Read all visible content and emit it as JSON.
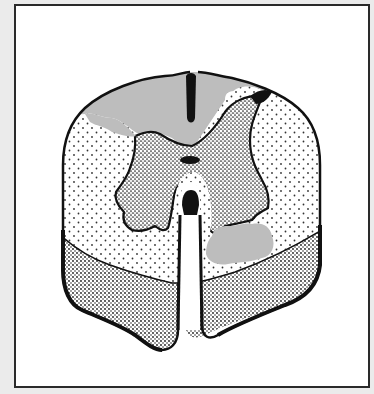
{
  "figure": {
    "caption": "",
    "colors": {
      "background": "#ebebeb",
      "frame_fill": "#ffffff",
      "frame_border": "#2a2a2a",
      "outline": "#111111",
      "lesion_gray": "#bdbdbd",
      "white_matter_dots": "#333333",
      "gray_matter_stipple": "#222222"
    },
    "regions": [
      {
        "name": "dorsal-columns-lesion",
        "fill": "gray"
      },
      {
        "name": "lateral-white-matter",
        "fill": "sparse-dots"
      },
      {
        "name": "gray-matter-butterfly",
        "fill": "dense-stipple"
      },
      {
        "name": "ventral-white-matter",
        "fill": "dense-stipple"
      },
      {
        "name": "right-anterolateral-lesion",
        "fill": "gray"
      },
      {
        "name": "left-dorsolateral-lesion",
        "fill": "gray"
      },
      {
        "name": "central-canal",
        "fill": "black"
      },
      {
        "name": "anterior-median-fissure",
        "fill": "white"
      },
      {
        "name": "posterior-median-septum",
        "fill": "black"
      }
    ]
  }
}
